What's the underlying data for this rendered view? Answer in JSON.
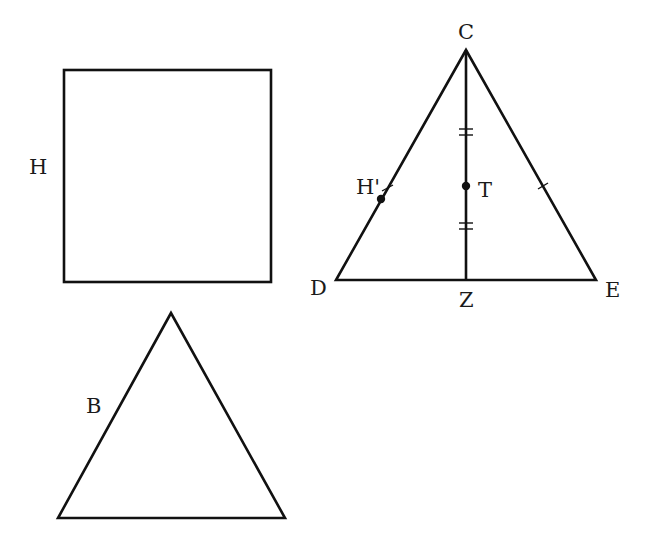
{
  "figure": {
    "square": {
      "label": "H",
      "x": 64,
      "y": 70,
      "width": 207,
      "height": 212
    },
    "triangle_small": {
      "label": "B",
      "apex": [
        171,
        313
      ],
      "left": [
        58,
        518
      ],
      "right": [
        285,
        518
      ]
    },
    "triangle_large": {
      "vertices": {
        "C": {
          "label": "C",
          "point": [
            466,
            50
          ]
        },
        "D": {
          "label": "D",
          "point": [
            336,
            280
          ]
        },
        "E": {
          "label": "E",
          "point": [
            596,
            280
          ]
        }
      },
      "foot": {
        "label": "Z",
        "point": [
          466,
          280
        ]
      },
      "midpoint_T": {
        "label": "T",
        "point": [
          466,
          186
        ]
      },
      "point_H_prime": {
        "label": "H'",
        "point": [
          381,
          199
        ]
      },
      "tick_marks": {
        "CT_double": "||",
        "TZ_double": "||",
        "CD_single": "|",
        "CE_single": "|"
      }
    },
    "colors": {
      "stroke": "#111111",
      "background": "#ffffff"
    }
  }
}
